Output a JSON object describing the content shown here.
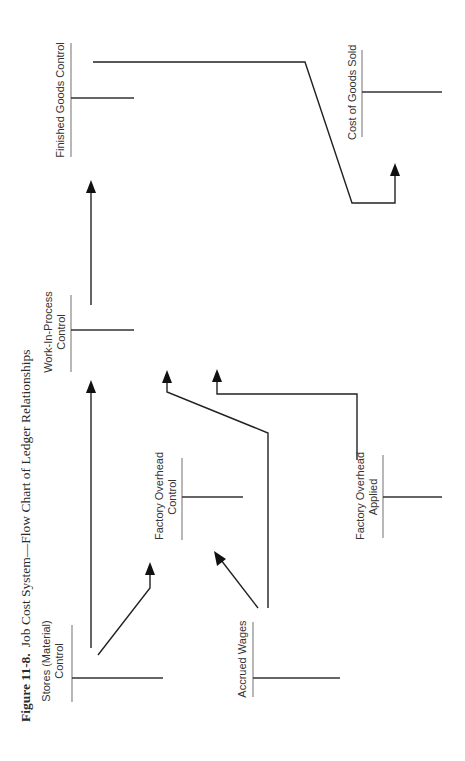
{
  "figure": {
    "number": "Figure 11-8.",
    "title": "Job Cost System—Flow Chart of Ledger Relationships"
  },
  "accounts": [
    {
      "id": "stores",
      "label_line1": "Stores (Material)",
      "label_line2": "Control"
    },
    {
      "id": "accrued_wages",
      "label_line1": "Accrued Wages",
      "label_line2": ""
    },
    {
      "id": "factory_overhead_control",
      "label_line1": "Factory Overhead",
      "label_line2": "Control"
    },
    {
      "id": "factory_overhead_applied",
      "label_line1": "Factory Overhead",
      "label_line2": "Applied"
    },
    {
      "id": "work_in_process",
      "label_line1": "Work-In-Process",
      "label_line2": "Control"
    },
    {
      "id": "finished_goods",
      "label_line1": "Finished Goods Control",
      "label_line2": ""
    },
    {
      "id": "cost_of_goods_sold",
      "label_line1": "Cost of Goods Sold",
      "label_line2": ""
    }
  ],
  "flows": [
    {
      "from": "Stores (Material) Control",
      "to": "Work-In-Process Control"
    },
    {
      "from": "Stores (Material) Control",
      "to": "Factory Overhead Control"
    },
    {
      "from": "Accrued Wages",
      "to": "Factory Overhead Control"
    },
    {
      "from": "Accrued Wages",
      "to": "Work-In-Process Control"
    },
    {
      "from": "Factory Overhead Applied",
      "to": "Work-In-Process Control"
    },
    {
      "from": "Work-In-Process Control",
      "to": "Finished Goods Control"
    },
    {
      "from": "Finished Goods Control",
      "to": "Cost of Goods Sold"
    }
  ],
  "orientation": "rotated -90deg (landscape page shown in portrait)"
}
